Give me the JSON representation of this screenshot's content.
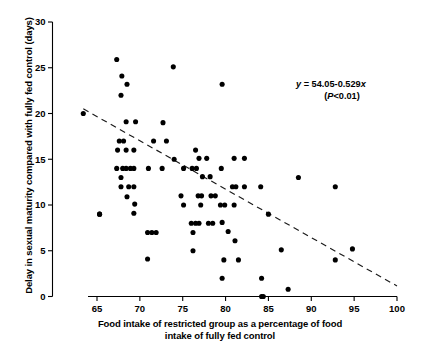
{
  "chart_data": {
    "type": "scatter",
    "title": "",
    "xlabel": "Food intake of restricted group as a percentage of food intake of fully fed control",
    "xlabel_line1": "Food intake of restricted group as a percentage of food",
    "xlabel_line2": "intake of fully fed control",
    "ylabel": "Delay in sexual maturity compared with fully fed control (days)",
    "xlim": [
      63.0,
      100.0
    ],
    "ylim": [
      0,
      30
    ],
    "xticks": [
      65,
      70,
      75,
      80,
      85,
      90,
      95,
      100
    ],
    "yticks": [
      0,
      5,
      10,
      15,
      20,
      25,
      30
    ],
    "grid": false,
    "legend": "none",
    "annotation_line1": "y = 54.05-0.529x",
    "annotation_line2": "(P<0.01)",
    "annotation_eq_y": "y",
    "annotation_eq_rest": " = 54.05-0.529",
    "annotation_eq_x": "x",
    "annotation_p_open": "(",
    "annotation_p_italic": "P",
    "annotation_p_rest": "<0.01)",
    "fit": {
      "intercept": 54.05,
      "slope": -0.529,
      "x_start": 63.4,
      "x_end": 100.0,
      "style": "dashed"
    },
    "points": [
      [
        63.4,
        20.0
      ],
      [
        65.3,
        9.0
      ],
      [
        67.3,
        25.9
      ],
      [
        67.9,
        24.1
      ],
      [
        68.5,
        23.2
      ],
      [
        67.8,
        22.0
      ],
      [
        73.9,
        25.1
      ],
      [
        79.6,
        23.2
      ],
      [
        68.4,
        19.1
      ],
      [
        69.5,
        19.1
      ],
      [
        72.7,
        19.0
      ],
      [
        67.6,
        17.0
      ],
      [
        68.1,
        17.0
      ],
      [
        71.6,
        17.0
      ],
      [
        73.1,
        17.0
      ],
      [
        67.4,
        16.0
      ],
      [
        68.4,
        16.0
      ],
      [
        69.3,
        16.0
      ],
      [
        76.5,
        16.0
      ],
      [
        74.0,
        15.0
      ],
      [
        76.9,
        15.1
      ],
      [
        77.8,
        15.1
      ],
      [
        81.0,
        15.1
      ],
      [
        82.2,
        15.1
      ],
      [
        67.3,
        14.0
      ],
      [
        68.0,
        14.0
      ],
      [
        68.4,
        14.0
      ],
      [
        68.9,
        14.0
      ],
      [
        69.3,
        14.0
      ],
      [
        71.0,
        14.0
      ],
      [
        72.6,
        14.0
      ],
      [
        75.1,
        14.0
      ],
      [
        76.1,
        14.0
      ],
      [
        76.6,
        14.0
      ],
      [
        79.5,
        14.0
      ],
      [
        67.8,
        13.0
      ],
      [
        77.3,
        13.1
      ],
      [
        78.2,
        13.1
      ],
      [
        88.5,
        13.0
      ],
      [
        67.8,
        12.0
      ],
      [
        68.7,
        12.0
      ],
      [
        69.3,
        12.0
      ],
      [
        80.8,
        12.0
      ],
      [
        81.2,
        12.0
      ],
      [
        82.2,
        12.0
      ],
      [
        84.1,
        12.0
      ],
      [
        92.8,
        12.0
      ],
      [
        68.5,
        10.9
      ],
      [
        74.8,
        11.0
      ],
      [
        76.8,
        11.0
      ],
      [
        77.2,
        11.0
      ],
      [
        78.3,
        11.0
      ],
      [
        78.8,
        11.0
      ],
      [
        69.4,
        10.1
      ],
      [
        75.1,
        10.0
      ],
      [
        77.1,
        10.0
      ],
      [
        79.4,
        10.0
      ],
      [
        79.9,
        10.0
      ],
      [
        81.0,
        10.0
      ],
      [
        65.3,
        9.0
      ],
      [
        69.3,
        9.1
      ],
      [
        85.0,
        9.0
      ],
      [
        76.0,
        8.0
      ],
      [
        76.5,
        8.0
      ],
      [
        76.9,
        8.0
      ],
      [
        78.0,
        8.0
      ],
      [
        78.5,
        8.0
      ],
      [
        79.6,
        8.1
      ],
      [
        76.2,
        7.0
      ],
      [
        70.9,
        7.0
      ],
      [
        71.4,
        7.0
      ],
      [
        71.9,
        7.0
      ],
      [
        80.3,
        7.1
      ],
      [
        81.1,
        6.1
      ],
      [
        86.5,
        5.1
      ],
      [
        94.8,
        5.2
      ],
      [
        76.2,
        5.0
      ],
      [
        70.9,
        4.1
      ],
      [
        79.8,
        4.0
      ],
      [
        81.5,
        4.0
      ],
      [
        92.8,
        4.0
      ],
      [
        79.6,
        2.0
      ],
      [
        84.2,
        2.0
      ],
      [
        87.3,
        0.8
      ],
      [
        84.2,
        0.0
      ],
      [
        84.4,
        0.0
      ]
    ]
  }
}
